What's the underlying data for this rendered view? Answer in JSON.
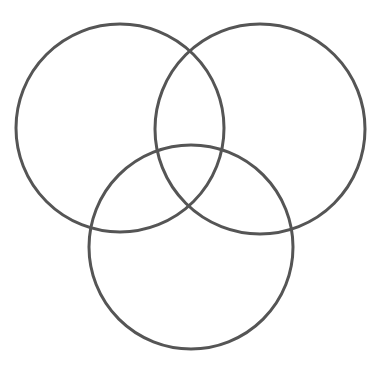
{
  "diagram": {
    "type": "venn",
    "stroke_color": "#555555",
    "background": "#ffffff",
    "stroke_width": 3,
    "circles": [
      {
        "id": "left",
        "cx": 120,
        "cy": 128,
        "r": 104
      },
      {
        "id": "right",
        "cx": 260,
        "cy": 129,
        "r": 105
      },
      {
        "id": "bottom",
        "cx": 191,
        "cy": 247,
        "r": 102
      }
    ]
  }
}
